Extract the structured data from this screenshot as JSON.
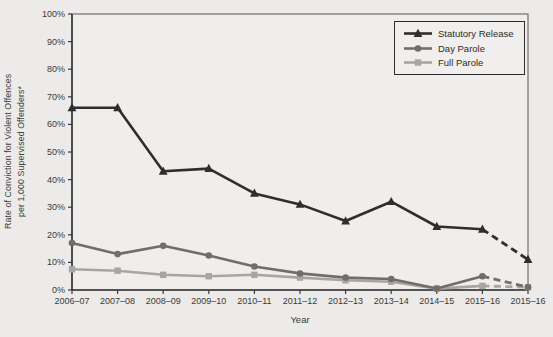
{
  "chart_data": {
    "type": "line",
    "title": "",
    "xlabel": "Year",
    "ylabel": "Rate of Conviction for Violent Offences per 1,000 Supervised Offenders*",
    "ylabel_lines": [
      "Rate of Conviction for Violent Offences",
      "per 1,000 Supervised Offenders*"
    ],
    "categories": [
      "2006–07",
      "2007–08",
      "2008–09",
      "2009–10",
      "2010–11",
      "2011–12",
      "2012–13",
      "2013–14",
      "2014–15",
      "2015–16",
      "2015–16"
    ],
    "y_ticks": [
      "0%",
      "10%",
      "20%",
      "30%",
      "40%",
      "50%",
      "60%",
      "70%",
      "80%",
      "90%",
      "100%"
    ],
    "ylim": [
      0,
      100
    ],
    "grid": false,
    "legend_position": "top-right-inside",
    "last_segment_style": "dashed",
    "series": [
      {
        "name": "Statutory Release",
        "marker": "triangle",
        "color": "#2f2e2c",
        "dashed_from_index": 9,
        "values": [
          66,
          66,
          43,
          44,
          35,
          31,
          25,
          32,
          23,
          22,
          11
        ]
      },
      {
        "name": "Day Parole",
        "marker": "circle",
        "color": "#6f6e6c",
        "dashed_from_index": 9,
        "values": [
          17,
          13,
          16,
          12.5,
          8.5,
          6,
          4.5,
          4,
          0.5,
          5,
          1
        ]
      },
      {
        "name": "Full Parole",
        "marker": "square",
        "color": "#a7a6a3",
        "dashed_from_index": 9,
        "values": [
          7.5,
          7,
          5.5,
          5,
          5.5,
          4.5,
          3.5,
          3,
          0.5,
          1.5,
          1
        ]
      }
    ]
  }
}
